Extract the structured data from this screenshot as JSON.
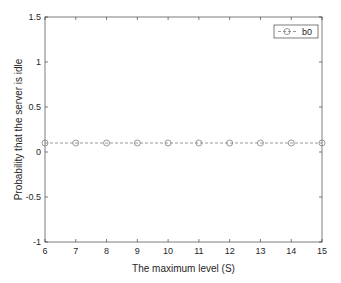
{
  "chart_data": {
    "type": "line",
    "title": "",
    "xlabel": "The maximum level (S)",
    "ylabel": "Probability that the server is idle",
    "xlim": [
      6,
      15
    ],
    "ylim": [
      -1,
      1.5
    ],
    "xticks": [
      6,
      7,
      8,
      9,
      10,
      11,
      12,
      13,
      14,
      15
    ],
    "yticks": [
      -1,
      -0.5,
      0,
      0.5,
      1,
      1.5
    ],
    "xtick_labels": [
      "6",
      "7",
      "8",
      "9",
      "10",
      "11",
      "12",
      "13",
      "14",
      "15"
    ],
    "ytick_labels": [
      "-1",
      "-0.5",
      "0",
      "0.5",
      "1",
      "1.5"
    ],
    "grid": false,
    "legend_position": "upper right",
    "x": [
      6,
      7,
      8,
      9,
      10,
      11,
      12,
      13,
      14,
      15
    ],
    "series": [
      {
        "name": "b0",
        "values": [
          0.1,
          0.1,
          0.1,
          0.1,
          0.1,
          0.1,
          0.1,
          0.1,
          0.1,
          0.1
        ],
        "line_style": "dashed",
        "marker": "circle-open",
        "color": "#808080"
      }
    ]
  },
  "colors": {
    "axis": "#262626",
    "series": "#808080",
    "background": "#ffffff"
  }
}
